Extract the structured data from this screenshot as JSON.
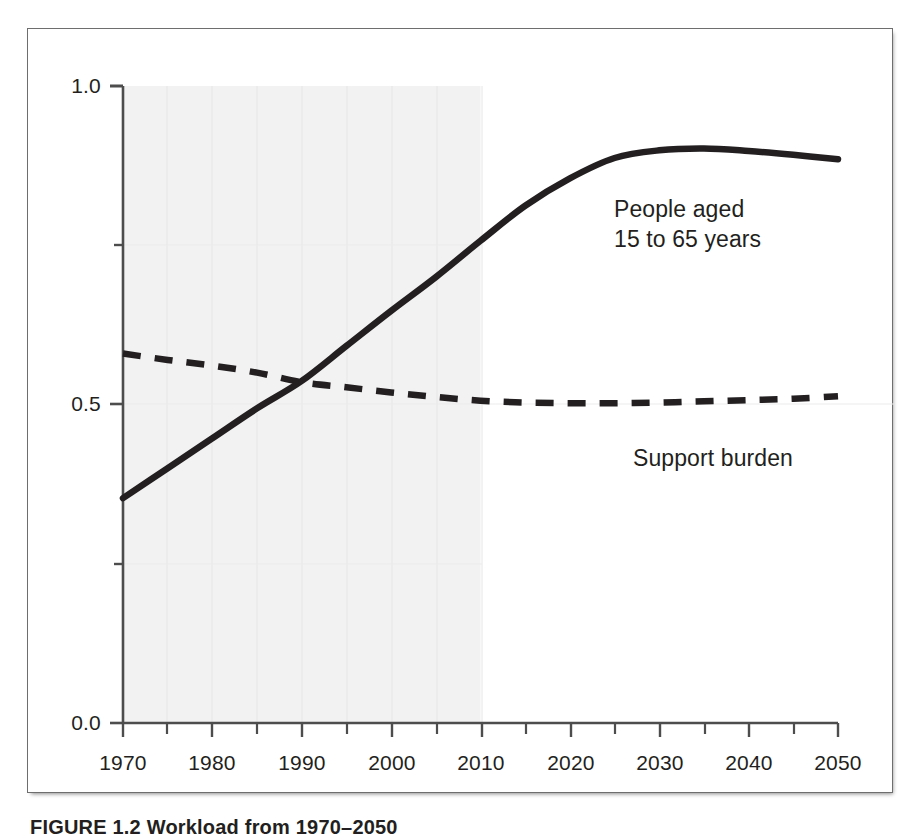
{
  "figure": {
    "caption": "FIGURE 1.2  Workload from 1970–2050",
    "frame_color": "#6e6e6e",
    "background": "#ffffff",
    "shading_color": "#f2f2f2",
    "grid_color": "#e8e8e8",
    "line_color": "#231f20"
  },
  "annotations": {
    "solid_label_line1": "People aged",
    "solid_label_line2": "15 to 65 years",
    "dashed_label": "Support burden"
  },
  "axes": {
    "y_ticks": [
      "1.0",
      "0.5",
      "0.0"
    ],
    "x_ticks": [
      "1970",
      "1980",
      "1990",
      "2000",
      "2010",
      "2020",
      "2030",
      "2040",
      "2050"
    ]
  },
  "chart_data": {
    "type": "line",
    "title": "",
    "xlabel": "",
    "ylabel": "",
    "xlim": [
      1970,
      2050
    ],
    "ylim": [
      0.0,
      1.0
    ],
    "grid": true,
    "legend": "in-plot annotations",
    "y_tick_values": [
      1.0,
      0.5,
      0.0
    ],
    "y_minor_tick_values": [
      0.75,
      0.25
    ],
    "x_tick_values": [
      1970,
      1980,
      1990,
      2000,
      2010,
      2020,
      2030,
      2040,
      2050
    ],
    "x_minor_tick_values": [
      1975,
      1985,
      1995,
      2005,
      2015,
      2025,
      2035,
      2045
    ],
    "shaded_region": {
      "label": "historical",
      "x_start": 1970,
      "x_end": 2010,
      "color": "#f2f2f2"
    },
    "x": [
      1970,
      1975,
      1980,
      1985,
      1990,
      1995,
      2000,
      2005,
      2010,
      2015,
      2020,
      2025,
      2030,
      2035,
      2040,
      2045,
      2050
    ],
    "series": [
      {
        "name": "People aged 15 to 65 years",
        "style": "solid",
        "color": "#231f20",
        "values": [
          0.353,
          0.4,
          0.447,
          0.494,
          0.537,
          0.592,
          0.647,
          0.7,
          0.757,
          0.812,
          0.855,
          0.887,
          0.899,
          0.902,
          0.898,
          0.892,
          0.885
        ]
      },
      {
        "name": "Support burden",
        "style": "dashed",
        "color": "#231f20",
        "values": [
          0.58,
          0.57,
          0.561,
          0.55,
          0.535,
          0.527,
          0.519,
          0.512,
          0.506,
          0.503,
          0.502,
          0.502,
          0.503,
          0.505,
          0.507,
          0.509,
          0.513
        ]
      }
    ],
    "annotations": [
      {
        "text": "People aged 15 to 65 years",
        "x": 2022,
        "y": 0.835,
        "series": "People aged 15 to 65 years"
      },
      {
        "text": "Support burden",
        "x": 2030,
        "y": 0.455,
        "series": "Support burden"
      }
    ]
  }
}
